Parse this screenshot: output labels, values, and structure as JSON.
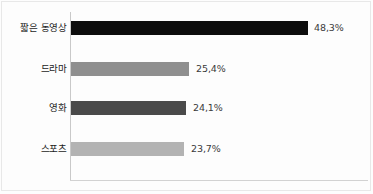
{
  "chart_data": {
    "type": "bar",
    "orientation": "horizontal",
    "title": "",
    "xlabel": "",
    "ylabel": "",
    "categories": [
      "짧은 동영상",
      "드라마",
      "영화",
      "스포츠"
    ],
    "values": [
      48.3,
      25.4,
      24.1,
      23.7
    ],
    "value_labels": [
      "48,3%",
      "25,4%",
      "24,1%",
      "23,7%"
    ],
    "unit": "%",
    "xlim": [
      0,
      58
    ],
    "grid": false,
    "legend": false,
    "bar_colors": [
      "#0d0d0d",
      "#8f8f8f",
      "#4a4a4a",
      "#b3b3b3"
    ]
  },
  "axes": {
    "y_axis_color": "#c9c9c9",
    "x_axis_color": "#d2d2d2",
    "frame_color": "#e8e8e8",
    "background": "#fdfdfd"
  },
  "bars": [
    {
      "label": "짧은 동영상",
      "value_label": "48,3%",
      "color": "#0d0d0d",
      "width_px": 237,
      "top_px": 20,
      "value_left_px": 314,
      "label_left_px": 3
    },
    {
      "label": "드라마",
      "value_label": "25,4%",
      "color": "#8f8f8f",
      "width_px": 118,
      "top_px": 61,
      "value_left_px": 196,
      "label_left_px": 3
    },
    {
      "label": "영화",
      "value_label": "24,1%",
      "color": "#4a4a4a",
      "width_px": 115,
      "top_px": 100,
      "value_left_px": 193,
      "label_left_px": 3
    },
    {
      "label": "스포츠",
      "value_label": "23,7%",
      "color": "#b3b3b3",
      "width_px": 113,
      "top_px": 141,
      "value_left_px": 191,
      "label_left_px": 3
    }
  ]
}
